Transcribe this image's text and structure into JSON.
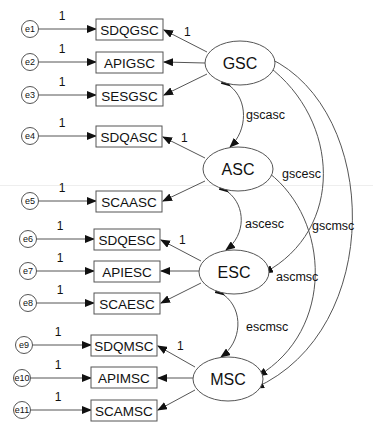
{
  "diagram": {
    "type": "structural-equation-model",
    "latent_variables": [
      {
        "id": "GSC",
        "label": "GSC",
        "cx": 240,
        "cy": 63
      },
      {
        "id": "ASC",
        "label": "ASC",
        "cx": 238,
        "cy": 169
      },
      {
        "id": "ESC",
        "label": "ESC",
        "cx": 234,
        "cy": 272
      },
      {
        "id": "MSC",
        "label": "MSC",
        "cx": 228,
        "cy": 379
      }
    ],
    "observed_variables": [
      {
        "label": "SDQGSC",
        "y": 29,
        "latent": "GSC",
        "loading_label": "1"
      },
      {
        "label": "APIGSC",
        "y": 62,
        "latent": "GSC"
      },
      {
        "label": "SESGSC",
        "y": 95,
        "latent": "GSC"
      },
      {
        "label": "SDQASC",
        "y": 136,
        "latent": "ASC",
        "loading_label": "1"
      },
      {
        "label": "SCAASC",
        "y": 201,
        "latent": "ASC"
      },
      {
        "label": "SDQESC",
        "y": 239,
        "latent": "ESC",
        "loading_label": "1"
      },
      {
        "label": "APIESC",
        "y": 271,
        "latent": "ESC"
      },
      {
        "label": "SCAESC",
        "y": 303,
        "latent": "ESC"
      },
      {
        "label": "SDQMSC",
        "y": 345,
        "latent": "MSC",
        "loading_label": "1"
      },
      {
        "label": "APIMSC",
        "y": 378,
        "latent": "MSC"
      },
      {
        "label": "SCAMSC",
        "y": 410,
        "latent": "MSC"
      }
    ],
    "error_terms": [
      {
        "label": "e1",
        "weight": "1"
      },
      {
        "label": "e2",
        "weight": "1"
      },
      {
        "label": "e3",
        "weight": "1"
      },
      {
        "label": "e4",
        "weight": "1"
      },
      {
        "label": "e5",
        "weight": "1"
      },
      {
        "label": "e6",
        "weight": "1"
      },
      {
        "label": "e7",
        "weight": "1"
      },
      {
        "label": "e8",
        "weight": "1"
      },
      {
        "label": "e9",
        "weight": "1"
      },
      {
        "label": "e10",
        "weight": "1"
      },
      {
        "label": "e11",
        "weight": "1"
      }
    ],
    "covariances": [
      {
        "label": "gscasc",
        "from": "GSC",
        "to": "ASC"
      },
      {
        "label": "gscesc",
        "from": "GSC",
        "to": "ESC"
      },
      {
        "label": "gscmsc",
        "from": "GSC",
        "to": "MSC"
      },
      {
        "label": "ascesc",
        "from": "ASC",
        "to": "ESC"
      },
      {
        "label": "ascmsc",
        "from": "ASC",
        "to": "MSC"
      },
      {
        "label": "escmsc",
        "from": "ESC",
        "to": "MSC"
      }
    ],
    "colors": {
      "stroke": "#555555",
      "text": "#111111",
      "background": "#ffffff",
      "arrowhead": "#111111"
    }
  }
}
